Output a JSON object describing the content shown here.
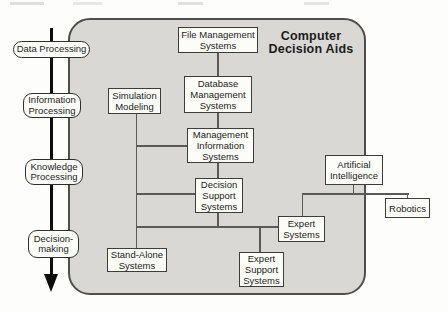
{
  "figure": {
    "title": "Computer\nDecision Aids"
  },
  "stages": [
    {
      "id": "data-processing",
      "label": "Data Processing"
    },
    {
      "id": "information-processing",
      "label": "Information\nProcessing"
    },
    {
      "id": "knowledge-processing",
      "label": "Knowledge\nProcessing"
    },
    {
      "id": "decision-making",
      "label": "Decision-\nmaking"
    }
  ],
  "nodes": [
    {
      "id": "file-management-systems",
      "label": "File Management\nSystems"
    },
    {
      "id": "database-management-systems",
      "label": "Database\nManagement\nSystems"
    },
    {
      "id": "management-information-systems",
      "label": "Management\nInformation\nSystems"
    },
    {
      "id": "decision-support-systems",
      "label": "Decision\nSupport\nSystems"
    },
    {
      "id": "simulation-modeling",
      "label": "Simulation\nModeling"
    },
    {
      "id": "stand-alone-systems",
      "label": "Stand-Alone\nSystems"
    },
    {
      "id": "expert-systems",
      "label": "Expert\nSystems"
    },
    {
      "id": "expert-support-systems",
      "label": "Expert\nSupport\nSystems"
    },
    {
      "id": "artificial-intelligence",
      "label": "Artificial\nIntelligence"
    },
    {
      "id": "robotics",
      "label": "Robotics"
    }
  ],
  "colors": {
    "panel_fill": "#d9d8d4",
    "panel_border": "#4e4e4c",
    "node_fill": "#fcfcf9",
    "node_border": "#3c3c3a",
    "connector": "#5a5a58",
    "arrow": "#0d0d0d",
    "text": "#1c1c1c",
    "page_background": "#fdfdfb"
  }
}
